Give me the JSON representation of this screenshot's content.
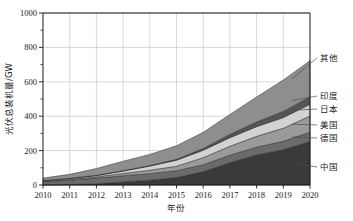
{
  "chart_data": {
    "type": "area",
    "title": "",
    "subtitle": "",
    "xlabel": "年份",
    "ylabel": "光伏总装机量/GW",
    "x": [
      2010,
      2011,
      2012,
      2013,
      2014,
      2015,
      2016,
      2017,
      2018,
      2019,
      2020
    ],
    "categories": [
      "2010",
      "2011",
      "2012",
      "2013",
      "2014",
      "2015",
      "2016",
      "2017",
      "2018",
      "2019",
      "2020"
    ],
    "xlim": [
      2010,
      2020
    ],
    "ylim": [
      0,
      1000
    ],
    "ytick_values": [
      0,
      200,
      400,
      600,
      800,
      1000
    ],
    "ytick_labels": [
      "0",
      "200",
      "400",
      "600",
      "800",
      "1000"
    ],
    "yminor_step": 100,
    "grid": "horizontal-and-vertical-light",
    "legend_position": "right-outside-with-leader-lines",
    "stacked": true,
    "series": [
      {
        "name": "中国",
        "color": "#3a3a3a",
        "values": [
          1,
          3,
          7,
          18,
          28,
          43,
          77,
          130,
          175,
          205,
          253
        ]
      },
      {
        "name": "德国",
        "color": "#6b6b6b",
        "values": [
          18,
          25,
          33,
          36,
          38,
          40,
          41,
          43,
          45,
          49,
          54
        ]
      },
      {
        "name": "美国",
        "color": "#9a9a9a",
        "values": [
          3,
          5,
          8,
          13,
          20,
          26,
          41,
          52,
          63,
          76,
          94
        ]
      },
      {
        "name": "日本",
        "color": "#d2d2d2",
        "values": [
          4,
          5,
          7,
          14,
          24,
          35,
          43,
          50,
          56,
          62,
          68
        ]
      },
      {
        "name": "印度",
        "color": "#555555",
        "values": [
          0,
          1,
          1,
          2,
          3,
          5,
          10,
          19,
          27,
          36,
          43
        ]
      },
      {
        "name": "其他",
        "color": "#8e8e8e",
        "values": [
          14,
          23,
          40,
          55,
          65,
          79,
          94,
          116,
          146,
          182,
          211
        ]
      }
    ],
    "stack_totals": [
      40,
      62,
      96,
      138,
      178,
      228,
      306,
      410,
      512,
      610,
      723
    ],
    "legend_entries": [
      {
        "label": "其他",
        "color": "#8e8e8e"
      },
      {
        "label": "印度",
        "color": "#555555"
      },
      {
        "label": "日本",
        "color": "#d2d2d2"
      },
      {
        "label": "美国",
        "color": "#9a9a9a"
      },
      {
        "label": "德国",
        "color": "#6b6b6b"
      },
      {
        "label": "中国",
        "color": "#3a3a3a"
      }
    ],
    "colors": {
      "axis": "#1a1a1a",
      "grid": "#bfbfbf",
      "background": "#ffffff",
      "leader_line": "#4d4d4d"
    }
  },
  "axes": {
    "y_ticks": [
      "0",
      "200",
      "400",
      "600",
      "800",
      "1000"
    ],
    "x_ticks": [
      "2010",
      "2011",
      "2012",
      "2013",
      "2014",
      "2015",
      "2016",
      "2017",
      "2018",
      "2019",
      "2020"
    ],
    "y_title": "光伏总装机量/GW",
    "x_title": "年份"
  },
  "legend": {
    "items": [
      {
        "label": "其他"
      },
      {
        "label": "印度"
      },
      {
        "label": "日本"
      },
      {
        "label": "美国"
      },
      {
        "label": "德国"
      },
      {
        "label": "中国"
      }
    ]
  }
}
